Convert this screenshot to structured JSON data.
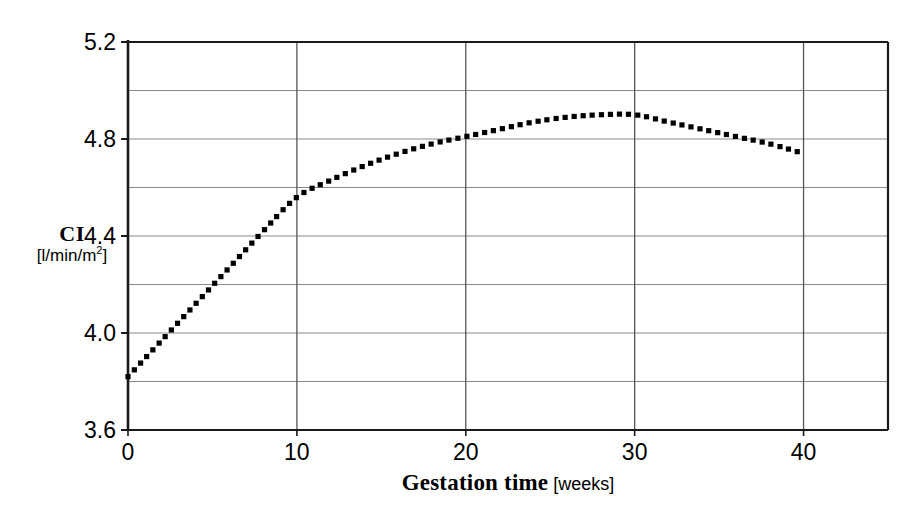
{
  "chart_data": {
    "type": "line",
    "title": "",
    "subtitle": "",
    "xlabel_main": "Gestation time",
    "xlabel_units": "[weeks]",
    "ylabel_main": "CI",
    "ylabel_units_pre": "[l/min/m",
    "ylabel_units_sup": "2",
    "ylabel_units_post": "]",
    "xlim": [
      0,
      45
    ],
    "ylim": [
      3.6,
      5.2
    ],
    "xticks": [
      0,
      10,
      20,
      30,
      40
    ],
    "xtick_labels": [
      "0",
      "10",
      "20",
      "30",
      "40"
    ],
    "yticks": [
      3.6,
      4.0,
      4.4,
      4.8,
      5.2
    ],
    "ytick_labels": [
      "3.6",
      "4.0",
      "4.4",
      "4.8",
      "5.2"
    ],
    "y_gridlines": [
      3.6,
      3.8,
      4.0,
      4.2,
      4.4,
      4.6,
      4.8,
      5.0,
      5.2
    ],
    "x_gridlines": [
      0,
      10,
      20,
      30,
      40
    ],
    "grid": true,
    "legend": "none",
    "line_style": "dotted",
    "line_color": "#000000",
    "grid_color": "#8a8a8a",
    "axis_color": "#1a1a1a",
    "background_color": "#ffffff",
    "series": [
      {
        "name": "Cardiac Index",
        "x": [
          0,
          2,
          4,
          6,
          8,
          10,
          12,
          14,
          16,
          18,
          20,
          22,
          24,
          26,
          28,
          30,
          32,
          34,
          36,
          38,
          40
        ],
        "values": [
          3.82,
          3.97,
          4.12,
          4.27,
          4.42,
          4.56,
          4.63,
          4.69,
          4.74,
          4.78,
          4.81,
          4.84,
          4.87,
          4.89,
          4.9,
          4.9,
          4.87,
          4.84,
          4.81,
          4.78,
          4.74
        ]
      }
    ]
  }
}
